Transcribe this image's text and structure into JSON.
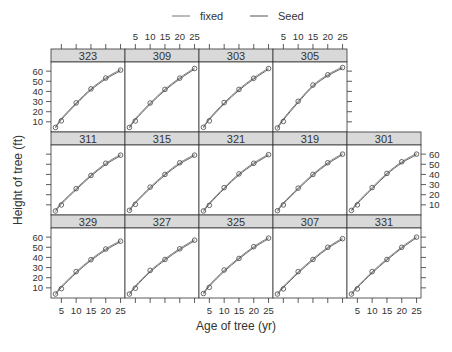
{
  "chart_data": {
    "type": "line",
    "title": "",
    "xlabel": "Age of tree (yr)",
    "ylabel": "Height of tree (ft)",
    "xlim": [
      1.5,
      26.5
    ],
    "ylim": [
      0,
      69
    ],
    "x_ticks": [
      5,
      10,
      15,
      20,
      25
    ],
    "y_ticks": [
      10,
      20,
      30,
      40,
      50,
      60
    ],
    "legend": [
      {
        "name": "fixed",
        "color": "#777777"
      },
      {
        "name": "Seed",
        "color": "#555555"
      }
    ],
    "legend_position": "top",
    "grid": false,
    "x": [
      3,
      5,
      10,
      15,
      20,
      25
    ],
    "panels": [
      {
        "seed": "323",
        "row": 0,
        "col": 0,
        "points": [
          4.5,
          11.0,
          28.7,
          42.5,
          53.2,
          61.0
        ]
      },
      {
        "seed": "309",
        "row": 0,
        "col": 1,
        "points": [
          4.5,
          10.9,
          28.6,
          42.0,
          53.1,
          62.6
        ]
      },
      {
        "seed": "303",
        "row": 0,
        "col": 2,
        "points": [
          4.6,
          11.0,
          29.0,
          42.0,
          53.0,
          62.5
        ]
      },
      {
        "seed": "305",
        "row": 0,
        "col": 3,
        "points": [
          4.0,
          10.4,
          30.3,
          46.3,
          56.4,
          63.5
        ]
      },
      {
        "seed": "311",
        "row": 1,
        "col": 0,
        "points": [
          4.0,
          9.9,
          26.0,
          39.0,
          51.0,
          59.0
        ]
      },
      {
        "seed": "315",
        "row": 1,
        "col": 1,
        "points": [
          4.6,
          10.5,
          27.5,
          40.0,
          51.5,
          59.0
        ]
      },
      {
        "seed": "321",
        "row": 1,
        "col": 2,
        "points": [
          4.0,
          9.5,
          27.0,
          40.5,
          51.0,
          59.5
        ]
      },
      {
        "seed": "319",
        "row": 1,
        "col": 3,
        "points": [
          4.2,
          9.9,
          26.5,
          40.0,
          51.5,
          60.0
        ]
      },
      {
        "seed": "301",
        "row": 1,
        "col": 4,
        "points": [
          4.5,
          10.0,
          27.0,
          41.0,
          52.5,
          60.0
        ]
      },
      {
        "seed": "329",
        "row": 2,
        "col": 0,
        "points": [
          3.9,
          9.2,
          26.0,
          37.8,
          48.3,
          56.0
        ]
      },
      {
        "seed": "327",
        "row": 2,
        "col": 1,
        "points": [
          3.9,
          9.6,
          27.2,
          38.0,
          48.5,
          57.0
        ]
      },
      {
        "seed": "325",
        "row": 2,
        "col": 2,
        "points": [
          4.4,
          10.5,
          27.6,
          39.0,
          50.6,
          59.0
        ]
      },
      {
        "seed": "307",
        "row": 2,
        "col": 3,
        "points": [
          3.9,
          9.0,
          26.0,
          38.0,
          50.0,
          58.5
        ]
      },
      {
        "seed": "331",
        "row": 2,
        "col": 4,
        "points": [
          3.9,
          9.0,
          26.0,
          38.0,
          50.0,
          60.0
        ]
      }
    ]
  }
}
